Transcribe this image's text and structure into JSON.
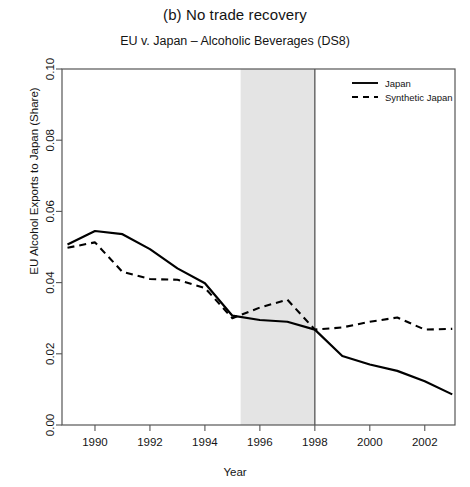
{
  "panel": {
    "title": "(b) No trade recovery",
    "xlabel": "Year",
    "ylabel": "EU Alcohol Exports to Japan (Share)"
  },
  "chart_data": {
    "type": "line",
    "title": "EU v. Japan – Alcoholic Beverages (DS8)",
    "xlabel": "Year",
    "ylabel": "EU Alcohol Exports to Japan (Share)",
    "xlim": [
      1988.8,
      2003.1
    ],
    "ylim": [
      0.0,
      0.1
    ],
    "xticks": [
      1990,
      1992,
      1994,
      1996,
      1998,
      2000,
      2002
    ],
    "xtick_labels": [
      "1990",
      "1992",
      "1994",
      "1996",
      "1998",
      "2000",
      "2002"
    ],
    "yticks": [
      0.0,
      0.02,
      0.04,
      0.06,
      0.08,
      0.1
    ],
    "ytick_labels": [
      "0.00",
      "0.02",
      "0.04",
      "0.06",
      "0.08",
      "0.10"
    ],
    "grid": false,
    "legend_position": "top-right",
    "shaded_band": {
      "x0": 1995.3,
      "x1": 1998.0,
      "color": "#e4e4e4",
      "label": "dispute period"
    },
    "vline": {
      "x": 1998.0,
      "color": "#555555"
    },
    "x": [
      1989,
      1990,
      1991,
      1992,
      1993,
      1994,
      1995,
      1996,
      1997,
      1998,
      1999,
      2000,
      2001,
      2002,
      2003
    ],
    "series": [
      {
        "name": "Japan",
        "style": "solid",
        "color": "#000000",
        "values": [
          0.0507,
          0.0545,
          0.0536,
          0.0494,
          0.044,
          0.0398,
          0.0307,
          0.0295,
          0.029,
          0.0268,
          0.0194,
          0.017,
          0.0152,
          0.0123,
          0.0086
        ]
      },
      {
        "name": "Synthetic Japan",
        "style": "dashed",
        "color": "#000000",
        "values": [
          0.0498,
          0.0513,
          0.043,
          0.041,
          0.0408,
          0.0385,
          0.03,
          0.033,
          0.0352,
          0.0268,
          0.0274,
          0.029,
          0.0302,
          0.0268,
          0.027
        ]
      }
    ]
  }
}
